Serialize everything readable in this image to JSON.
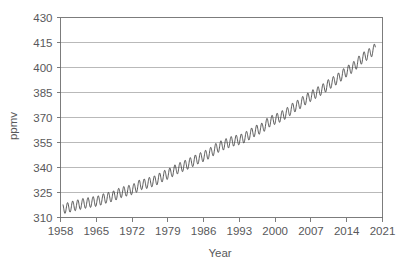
{
  "chart_data": {
    "type": "line",
    "title": "",
    "xlabel": "Year",
    "ylabel": "ppmv",
    "xlim": [
      1958,
      2021
    ],
    "ylim": [
      310,
      430
    ],
    "grid": "horizontal",
    "legend": "none",
    "x_ticks": [
      1958,
      1965,
      1972,
      1979,
      1986,
      1993,
      2000,
      2007,
      2014,
      2021
    ],
    "y_ticks": [
      310,
      325,
      340,
      355,
      370,
      385,
      400,
      415,
      430
    ],
    "series": [
      {
        "name": "Atmospheric CO2 (Mauna Loa monthly mean)",
        "color": "#3c3c3c",
        "x_start": 1958.5,
        "x_end": 2019.6,
        "seasonal_amplitude_ppm": 3.1,
        "seasonal_peak_month_fraction": 0.38,
        "annual_points": [
          {
            "year": 1958.5,
            "value": 315.3
          },
          {
            "year": 1959.5,
            "value": 315.9
          },
          {
            "year": 1960.5,
            "value": 316.9
          },
          {
            "year": 1961.5,
            "value": 317.6
          },
          {
            "year": 1962.5,
            "value": 318.4
          },
          {
            "year": 1963.5,
            "value": 318.9
          },
          {
            "year": 1964.5,
            "value": 319.5
          },
          {
            "year": 1965.5,
            "value": 320.0
          },
          {
            "year": 1966.5,
            "value": 321.3
          },
          {
            "year": 1967.5,
            "value": 322.1
          },
          {
            "year": 1968.5,
            "value": 323.0
          },
          {
            "year": 1969.5,
            "value": 324.6
          },
          {
            "year": 1970.5,
            "value": 325.6
          },
          {
            "year": 1971.5,
            "value": 326.3
          },
          {
            "year": 1972.5,
            "value": 327.4
          },
          {
            "year": 1973.5,
            "value": 329.6
          },
          {
            "year": 1974.5,
            "value": 330.1
          },
          {
            "year": 1975.5,
            "value": 331.1
          },
          {
            "year": 1976.5,
            "value": 332.0
          },
          {
            "year": 1977.5,
            "value": 333.8
          },
          {
            "year": 1978.5,
            "value": 335.4
          },
          {
            "year": 1979.5,
            "value": 336.8
          },
          {
            "year": 1980.5,
            "value": 338.7
          },
          {
            "year": 1981.5,
            "value": 340.1
          },
          {
            "year": 1982.5,
            "value": 341.4
          },
          {
            "year": 1983.5,
            "value": 343.0
          },
          {
            "year": 1984.5,
            "value": 344.6
          },
          {
            "year": 1985.5,
            "value": 346.0
          },
          {
            "year": 1986.5,
            "value": 347.4
          },
          {
            "year": 1987.5,
            "value": 349.2
          },
          {
            "year": 1988.5,
            "value": 351.6
          },
          {
            "year": 1989.5,
            "value": 353.1
          },
          {
            "year": 1990.5,
            "value": 354.4
          },
          {
            "year": 1991.5,
            "value": 355.6
          },
          {
            "year": 1992.5,
            "value": 356.4
          },
          {
            "year": 1993.5,
            "value": 357.1
          },
          {
            "year": 1994.5,
            "value": 358.8
          },
          {
            "year": 1995.5,
            "value": 360.8
          },
          {
            "year": 1996.5,
            "value": 362.6
          },
          {
            "year": 1997.5,
            "value": 363.7
          },
          {
            "year": 1998.5,
            "value": 366.7
          },
          {
            "year": 1999.5,
            "value": 368.4
          },
          {
            "year": 2000.5,
            "value": 369.6
          },
          {
            "year": 2001.5,
            "value": 371.2
          },
          {
            "year": 2002.5,
            "value": 373.2
          },
          {
            "year": 2003.5,
            "value": 375.8
          },
          {
            "year": 2004.5,
            "value": 377.5
          },
          {
            "year": 2005.5,
            "value": 379.8
          },
          {
            "year": 2006.5,
            "value": 381.9
          },
          {
            "year": 2007.5,
            "value": 383.8
          },
          {
            "year": 2008.5,
            "value": 385.6
          },
          {
            "year": 2009.5,
            "value": 387.4
          },
          {
            "year": 2010.5,
            "value": 389.9
          },
          {
            "year": 2011.5,
            "value": 391.7
          },
          {
            "year": 2012.5,
            "value": 393.9
          },
          {
            "year": 2013.5,
            "value": 396.5
          },
          {
            "year": 2014.5,
            "value": 398.7
          },
          {
            "year": 2015.5,
            "value": 400.8
          },
          {
            "year": 2016.5,
            "value": 404.2
          },
          {
            "year": 2017.5,
            "value": 406.6
          },
          {
            "year": 2018.5,
            "value": 408.5
          },
          {
            "year": 2019.6,
            "value": 411.5
          }
        ]
      }
    ]
  },
  "labels": {
    "y_axis_title": "ppmv",
    "x_axis_title": "Year"
  }
}
